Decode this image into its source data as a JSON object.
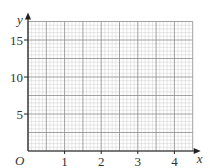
{
  "chart_data": {
    "type": "scatter",
    "title": "",
    "xlabel": "x",
    "ylabel": "y",
    "origin_label": "O",
    "xlim": [
      0,
      4.5
    ],
    "ylim": [
      0,
      17.5
    ],
    "x_ticks": [
      1,
      2,
      3,
      4
    ],
    "y_ticks": [
      5,
      10,
      15
    ],
    "x_tick_labels": [
      "1",
      "2",
      "3",
      "4"
    ],
    "y_tick_labels": [
      "5",
      "10",
      "15"
    ],
    "grid": true,
    "grid_major_x_step": 0.5,
    "grid_major_y_step": 2.5,
    "grid_minor_subdivisions": 5,
    "series": [],
    "legend": null
  },
  "colors": {
    "axis": "#222222",
    "major_grid": "#8a8a8a",
    "minor_grid": "#cfcfcf",
    "text": "#333333"
  }
}
